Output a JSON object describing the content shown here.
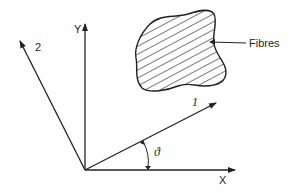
{
  "diagram": {
    "axes": {
      "x_label": "X",
      "y_label": "Y",
      "axis1_label": "1",
      "axis2_label": "2",
      "angle_label": "ϑ"
    },
    "region": {
      "label": "Fibres",
      "fill": "hatched"
    },
    "colors": {
      "stroke": "#222222",
      "background": "#ffffff"
    }
  }
}
